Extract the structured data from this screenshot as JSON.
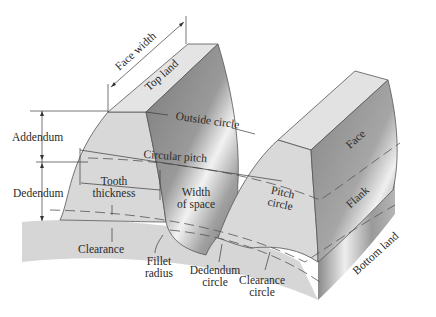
{
  "figure": {
    "labels": {
      "face_width": "Face width",
      "top_land": "Top land",
      "outside_circle": "Outside circle",
      "addendum": "Addendum",
      "circular_pitch": "Circular pitch",
      "dedendum": "Dedendum",
      "tooth_thickness_1": "Tooth",
      "tooth_thickness_2": "thickness",
      "width_of_space_1": "Width",
      "width_of_space_2": "of space",
      "pitch_circle_1": "Pitch",
      "pitch_circle_2": "circle",
      "face": "Face",
      "flank": "Flank",
      "bottom_land": "Bottom land",
      "clearance": "Clearance",
      "fillet_radius_1": "Fillet",
      "fillet_radius_2": "radius",
      "dedendum_circle_1": "Dedendum",
      "dedendum_circle_2": "circle",
      "clearance_circle_1": "Clearance",
      "clearance_circle_2": "circle"
    },
    "colors": {
      "light_face": "#d9d9d9",
      "top_face": "#e4e4e4",
      "dark_face": "#8f8f8f",
      "base": "#d4d4d4"
    }
  }
}
